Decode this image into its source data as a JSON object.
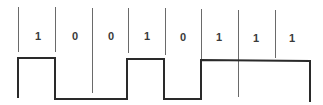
{
  "diagram": {
    "type": "digital-waveform",
    "encoding": "NRZ",
    "bits": [
      "1",
      "0",
      "0",
      "1",
      "0",
      "1",
      "1",
      "1"
    ],
    "colors": {
      "line": "#2a2a2a",
      "divider": "#6a6a6a",
      "label": "#3a3a3a",
      "background": "#ffffff"
    }
  }
}
